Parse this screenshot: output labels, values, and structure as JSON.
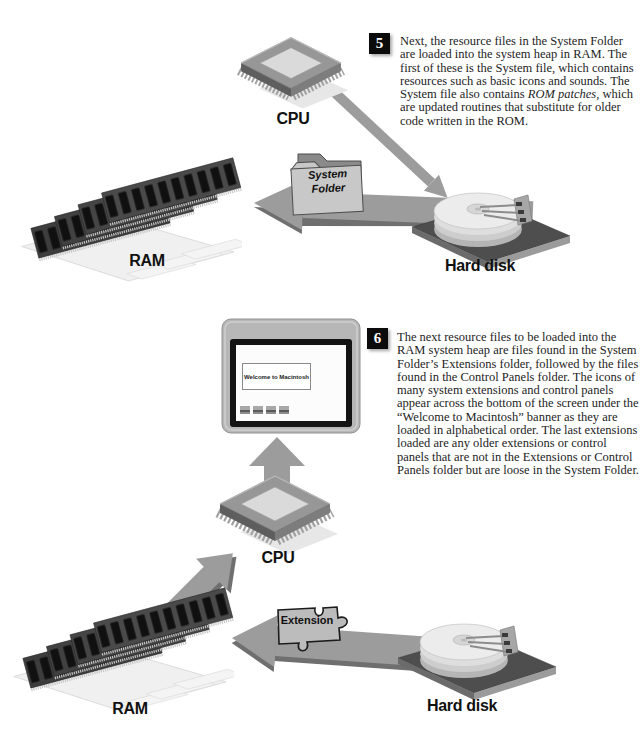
{
  "page": {
    "bg": "#ffffff"
  },
  "colors": {
    "arrow": "#9c9c9c",
    "arrow_dark": "#6f6f6f",
    "label": "#111111",
    "badge_bg": "#0b0b0b",
    "badge_fg": "#ffffff",
    "text": "#1d1d1d"
  },
  "labels": {
    "cpu": "CPU",
    "ram": "RAM",
    "hard_disk": "Hard disk",
    "system_folder": "System Folder",
    "extension": "Extension",
    "welcome_banner": "Welcome to Macintosh"
  },
  "steps": {
    "five": {
      "number": "5",
      "text_before": "Next, the resource files in the System Folder are loaded into the system heap in RAM. The first of these is the System file, which contains resources such as basic icons and sounds. The System file also contains ",
      "text_italic": "ROM patches,",
      "text_after": " which are updated routines that substitute for older code written in the ROM."
    },
    "six": {
      "number": "6",
      "text": "The next resource files to be loaded into the RAM system heap are files found in the System Folder’s Extensions folder, followed by the files found in the Control Panels folder. The icons of many system extensions and control panels appear across the bottom of the screen under the “Welcome to Macintosh” banner as they are loaded in alphabetical order. The last extensions loaded are any older extensions or control panels that are not in the Extensions or Control Panels folder but are loose in the System Folder."
    }
  }
}
